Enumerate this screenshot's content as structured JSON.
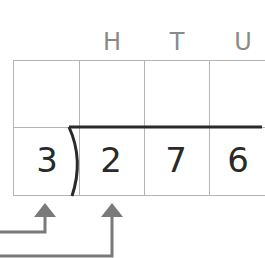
{
  "headers": [
    {
      "label": "H"
    },
    {
      "label": "T"
    },
    {
      "label": "U"
    }
  ],
  "divisor": "3",
  "dividend_digits": [
    "2",
    "7",
    "6"
  ],
  "colors": {
    "grid": "#b5b5b5",
    "header": "#8a8a8a",
    "digit": "#2a2a2a",
    "arrow": "#7a7a7a",
    "division_line": "#2a2a2a"
  }
}
